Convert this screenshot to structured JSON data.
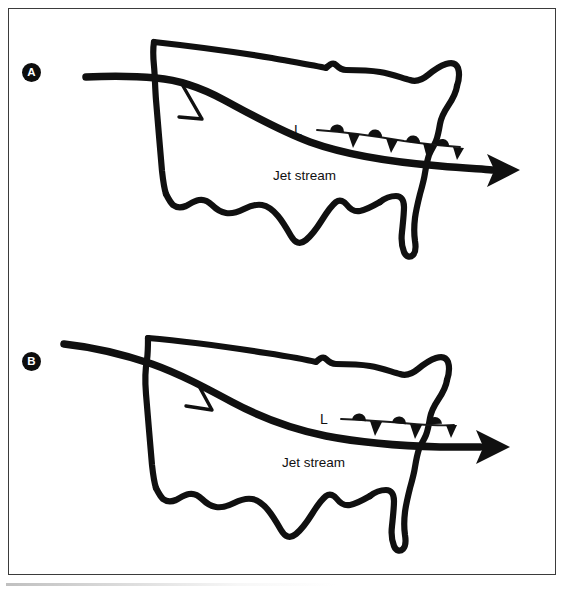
{
  "figure": {
    "background_color": "#ffffff",
    "ink_color": "#101010",
    "frame_color": "#3b3b3b"
  },
  "panels": [
    {
      "id": "A",
      "badge_label": "A",
      "jet_stream_label": "Jet stream",
      "low_pressure_label": "L",
      "front_type": "occluded-front",
      "front_symbol_counts": {
        "warm_semicircles": 4,
        "cold_triangles": 4
      },
      "description": "Hand-drawn outline map of the contiguous United States with a jet stream crossing from the west coast to off the east coast, and an occluded front extending east from a surface low"
    },
    {
      "id": "B",
      "badge_label": "B",
      "jet_stream_label": "Jet stream",
      "low_pressure_label": "L",
      "front_type": "occluded-front",
      "front_symbol_counts": {
        "warm_semicircles": 3,
        "cold_triangles": 3
      },
      "description": "Hand-drawn outline map of the contiguous United States with a more amplified jet stream entering farther north and an occluded front near the east coast"
    }
  ]
}
